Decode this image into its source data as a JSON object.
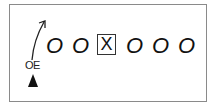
{
  "diagram": {
    "type": "football-formation",
    "route_arrow": "arrow-up-right-icon",
    "players": [
      {
        "symbol": "O",
        "x": 46
      },
      {
        "symbol": "O",
        "x": 72
      },
      {
        "symbol": "X",
        "x": 97,
        "boxed": true
      },
      {
        "symbol": "O",
        "x": 126
      },
      {
        "symbol": "O",
        "x": 152
      },
      {
        "symbol": "O",
        "x": 178
      }
    ],
    "labels": {
      "player_tag": "OE"
    },
    "marker": "triangle-up-icon"
  }
}
